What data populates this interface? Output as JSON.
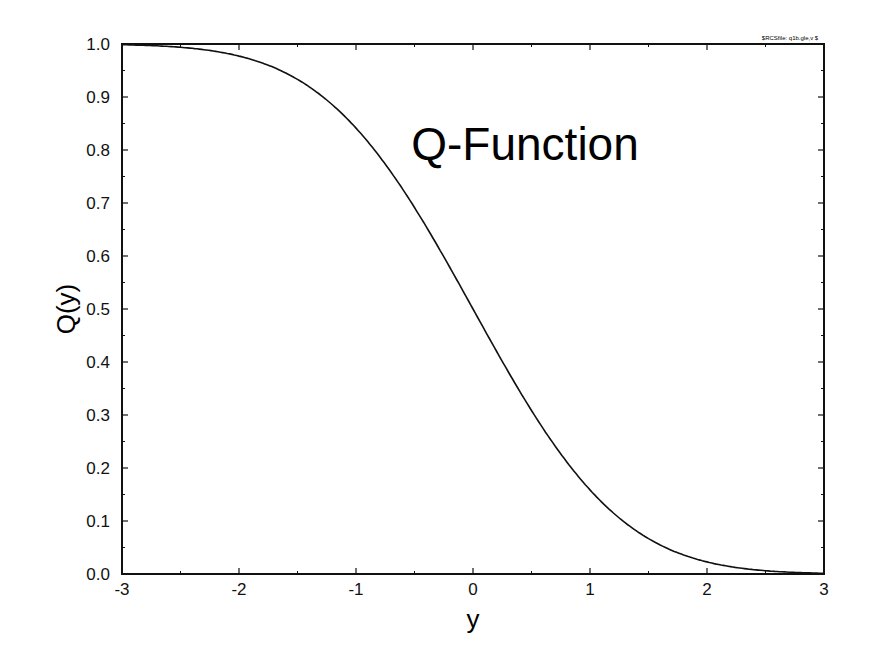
{
  "chart_data": {
    "type": "line",
    "title": "Q-Function",
    "corner_label": "$RCSfile: q1b.gle,v $",
    "xlabel": "y",
    "ylabel": "Q(y)",
    "xlim": [
      -3,
      3
    ],
    "ylim": [
      0,
      1
    ],
    "xticks": [
      "-3",
      "-2",
      "-1",
      "0",
      "1",
      "2",
      "3"
    ],
    "yticks": [
      "0.0",
      "0.1",
      "0.2",
      "0.3",
      "0.4",
      "0.5",
      "0.6",
      "0.7",
      "0.8",
      "0.9",
      "1.0"
    ],
    "grid": false,
    "series": [
      {
        "name": "Q(y)",
        "x": [
          -3,
          -2.5,
          -2,
          -1.5,
          -1,
          -0.5,
          0,
          0.5,
          1,
          1.5,
          2,
          2.5,
          3
        ],
        "y": [
          0.9987,
          0.9938,
          0.9772,
          0.9332,
          0.8413,
          0.6915,
          0.5,
          0.3085,
          0.1587,
          0.0668,
          0.0228,
          0.0062,
          0.0013
        ]
      }
    ]
  }
}
